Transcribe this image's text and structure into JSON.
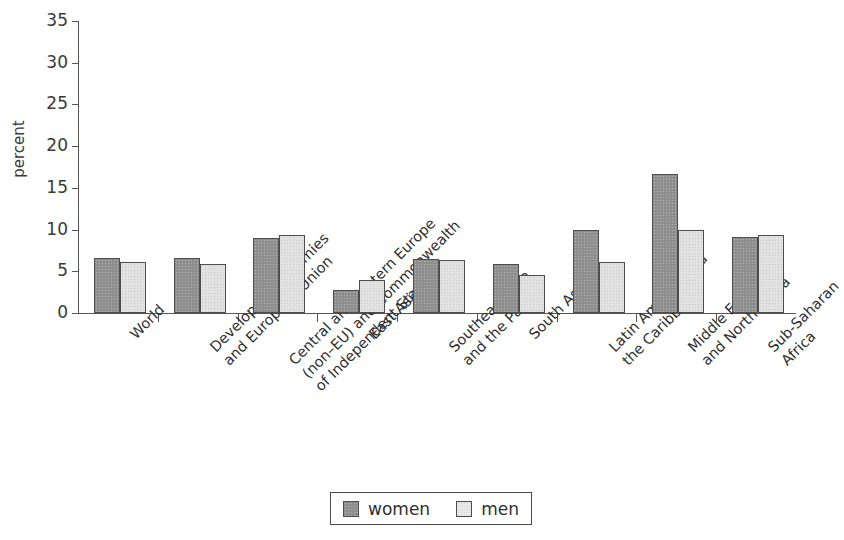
{
  "chart_data": {
    "type": "bar",
    "title": "",
    "subtitle": "",
    "xlabel": "",
    "ylabel": "percent",
    "ylim": [
      0,
      35
    ],
    "y_ticks": [
      0,
      5,
      10,
      15,
      20,
      25,
      30,
      35
    ],
    "grid": false,
    "legend_position": "bottom-center",
    "categories": [
      "World",
      "Developed economies\nand European Union",
      "Central and Eastern Europe\n(non–EU) and Commonwealth\nof Independent States",
      "East Asia",
      "Southeast Asia\nand the Pacific",
      "South Asia",
      "Latin America and\nthe Caribbean",
      "Middle East\nand North Africa",
      "Sub-Saharan\nAfrica"
    ],
    "series": [
      {
        "name": "women",
        "color": "#8e8e8e",
        "values": [
          6.6,
          6.6,
          9.0,
          2.8,
          6.5,
          5.9,
          10.0,
          16.7,
          9.1
        ]
      },
      {
        "name": "men",
        "color": "#e2e2e2",
        "values": [
          6.1,
          5.9,
          9.3,
          3.9,
          6.3,
          4.5,
          6.1,
          10.0,
          9.3
        ]
      }
    ]
  },
  "legend": {
    "entries": [
      {
        "label": "women",
        "swatch": "women"
      },
      {
        "label": "men",
        "swatch": "men"
      }
    ]
  }
}
